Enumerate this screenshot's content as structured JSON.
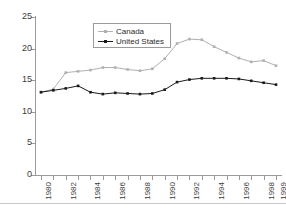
{
  "chart_data": {
    "type": "line",
    "title": "",
    "subtitle": "",
    "xlabel": "",
    "ylabel": "",
    "xlim": [
      1980,
      1999
    ],
    "ylim": [
      0,
      25
    ],
    "grid": false,
    "legend_position": "top-center",
    "x": [
      1980,
      1981,
      1982,
      1983,
      1984,
      1985,
      1986,
      1987,
      1988,
      1989,
      1990,
      1991,
      1992,
      1993,
      1994,
      1995,
      1996,
      1997,
      1998,
      1999
    ],
    "xtick_labels": [
      "1980",
      "",
      "1982",
      "",
      "1984",
      "",
      "1986",
      "",
      "1988",
      "",
      "1990",
      "",
      "1992",
      "",
      "1994",
      "",
      "1996",
      "",
      "1998",
      "1999"
    ],
    "ytick_labels": [
      "0",
      "5",
      "10",
      "15",
      "20",
      "25"
    ],
    "ytick_values": [
      0,
      5,
      10,
      15,
      20,
      25
    ],
    "series": [
      {
        "name": "Canada",
        "color": "#b0b0b0",
        "marker": "square",
        "values": [
          13.1,
          13.6,
          16.2,
          16.4,
          16.6,
          17.0,
          17.0,
          16.7,
          16.5,
          16.8,
          18.4,
          20.8,
          21.5,
          21.4,
          20.3,
          19.4,
          18.5,
          17.9,
          18.1,
          17.3
        ]
      },
      {
        "name": "United States",
        "color": "#1a1a1a",
        "marker": "square",
        "values": [
          13.1,
          13.4,
          13.7,
          14.1,
          13.1,
          12.8,
          13.0,
          12.9,
          12.8,
          12.9,
          13.5,
          14.7,
          15.1,
          15.3,
          15.3,
          15.3,
          15.2,
          14.9,
          14.6,
          14.3
        ]
      }
    ]
  },
  "legend": {
    "entries": [
      {
        "label": "Canada"
      },
      {
        "label": "United States"
      }
    ]
  }
}
